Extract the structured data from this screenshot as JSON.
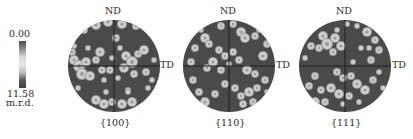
{
  "legend": {
    "min_label": "0.00",
    "max_label": "11.58",
    "unit": "m.r.d.",
    "gradient_stops": [
      "#4c4c4c",
      "#8a8a8a",
      "#d8d8d8",
      "#e6e6e6",
      "#bdbdbd",
      "#5a5a5a",
      "#3e3e3e"
    ]
  },
  "colors": {
    "disk": "#4a4a4a",
    "axis": "#1e1e1e",
    "spot": "#cfcfcf",
    "spot_mid": "#9a9a9a"
  },
  "chart_data": {
    "type": "heatmap",
    "colorbar": {
      "min": 0.0,
      "max": 11.58,
      "unit": "m.r.d."
    },
    "axis_labels": {
      "top": "ND",
      "right": "TD"
    },
    "figures": [
      {
        "label": "{100}",
        "cx": 114,
        "cy": 66,
        "r": 46,
        "spots": [
          [
            -18,
            -41,
            4
          ],
          [
            -6,
            -44,
            4
          ],
          [
            8,
            -42,
            4
          ],
          [
            22,
            -40,
            3
          ],
          [
            -30,
            -36,
            3
          ],
          [
            -42,
            -14,
            3
          ],
          [
            -40,
            -6,
            4
          ],
          [
            -35,
            0,
            5
          ],
          [
            -28,
            -4,
            4
          ],
          [
            -32,
            8,
            5
          ],
          [
            -24,
            10,
            4
          ],
          [
            -18,
            -6,
            3
          ],
          [
            -12,
            4,
            3
          ],
          [
            -26,
            -18,
            2
          ],
          [
            -14,
            -14,
            4
          ],
          [
            -2,
            -8,
            2
          ],
          [
            6,
            -18,
            2
          ],
          [
            12,
            -10,
            4
          ],
          [
            18,
            -4,
            5
          ],
          [
            24,
            -12,
            3
          ],
          [
            30,
            -16,
            4
          ],
          [
            10,
            2,
            4
          ],
          [
            20,
            8,
            3
          ],
          [
            32,
            6,
            3
          ],
          [
            40,
            -6,
            2
          ],
          [
            -4,
            4,
            3
          ],
          [
            -10,
            14,
            2
          ],
          [
            4,
            12,
            2
          ],
          [
            14,
            24,
            2
          ],
          [
            -8,
            26,
            2
          ],
          [
            -18,
            34,
            4
          ],
          [
            -10,
            38,
            4
          ],
          [
            -2,
            36,
            3
          ],
          [
            8,
            38,
            4
          ],
          [
            18,
            36,
            4
          ],
          [
            14,
            26,
            2
          ],
          [
            -36,
            22,
            2
          ],
          [
            34,
            22,
            2
          ],
          [
            38,
            14,
            2
          ],
          [
            2,
            -28,
            3
          ],
          [
            -40,
            -20,
            2
          ]
        ]
      },
      {
        "label": "{110}",
        "cx": 229,
        "cy": 66,
        "r": 46,
        "spots": [
          [
            -8,
            -40,
            3
          ],
          [
            4,
            -42,
            3
          ],
          [
            12,
            -34,
            4
          ],
          [
            16,
            -28,
            4
          ],
          [
            26,
            -30,
            3
          ],
          [
            -24,
            -28,
            4
          ],
          [
            -20,
            -22,
            3
          ],
          [
            -34,
            -18,
            3
          ],
          [
            -38,
            -4,
            3
          ],
          [
            -10,
            -16,
            3
          ],
          [
            -4,
            -10,
            3
          ],
          [
            -16,
            -4,
            4
          ],
          [
            -22,
            2,
            3
          ],
          [
            -8,
            4,
            3
          ],
          [
            4,
            -14,
            3
          ],
          [
            10,
            -6,
            3
          ],
          [
            18,
            4,
            4
          ],
          [
            26,
            8,
            3
          ],
          [
            34,
            -10,
            4
          ],
          [
            38,
            -22,
            3
          ],
          [
            36,
            14,
            3
          ],
          [
            38,
            26,
            2
          ],
          [
            -36,
            14,
            3
          ],
          [
            -30,
            26,
            3
          ],
          [
            -24,
            36,
            4
          ],
          [
            -14,
            28,
            3
          ],
          [
            -4,
            18,
            3
          ],
          [
            6,
            22,
            3
          ],
          [
            12,
            30,
            3
          ],
          [
            20,
            26,
            4
          ],
          [
            28,
            22,
            3
          ],
          [
            14,
            38,
            3
          ],
          [
            24,
            36,
            3
          ],
          [
            -40,
            -30,
            2
          ],
          [
            0,
            -2,
            2
          ],
          [
            -28,
            -36,
            2
          ],
          [
            30,
            -36,
            2
          ]
        ]
      },
      {
        "label": "{111}",
        "cx": 345,
        "cy": 66,
        "r": 46,
        "spots": [
          [
            -22,
            -30,
            4
          ],
          [
            -18,
            -22,
            5
          ],
          [
            -10,
            -28,
            4
          ],
          [
            -26,
            -18,
            3
          ],
          [
            -34,
            -20,
            3
          ],
          [
            -40,
            -8,
            2
          ],
          [
            -4,
            -20,
            4
          ],
          [
            -12,
            -14,
            3
          ],
          [
            12,
            -40,
            2
          ],
          [
            22,
            -34,
            4
          ],
          [
            30,
            -26,
            3
          ],
          [
            34,
            -16,
            3
          ],
          [
            16,
            -18,
            2
          ],
          [
            26,
            -6,
            3
          ],
          [
            -8,
            6,
            3
          ],
          [
            -2,
            12,
            3
          ],
          [
            6,
            10,
            3
          ],
          [
            8,
            -4,
            2
          ],
          [
            12,
            18,
            4
          ],
          [
            20,
            24,
            4
          ],
          [
            28,
            14,
            3
          ],
          [
            34,
            6,
            2
          ],
          [
            -30,
            10,
            3
          ],
          [
            -36,
            20,
            3
          ],
          [
            -24,
            24,
            3
          ],
          [
            -14,
            22,
            4
          ],
          [
            -6,
            28,
            4
          ],
          [
            -30,
            36,
            4
          ],
          [
            -20,
            36,
            3
          ],
          [
            4,
            30,
            3
          ],
          [
            14,
            36,
            2
          ],
          [
            -2,
            38,
            2
          ],
          [
            38,
            22,
            2
          ],
          [
            2,
            -42,
            2
          ],
          [
            -8,
            -36,
            2
          ],
          [
            24,
            -18,
            2
          ]
        ]
      }
    ]
  }
}
